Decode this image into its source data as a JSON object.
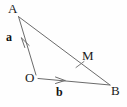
{
  "figure": {
    "type": "geometry-diagram",
    "background_color": "#fefefe",
    "stroke_color": "#5a5a5a",
    "label_color": "#1a1a1a",
    "width": 127,
    "height": 107
  },
  "points": {
    "A": {
      "label": "A",
      "x": 18,
      "y": 16,
      "label_x": 8,
      "label_y": 2
    },
    "O": {
      "label": "O",
      "x": 36,
      "y": 76,
      "label_x": 25,
      "label_y": 72
    },
    "B": {
      "label": "B",
      "x": 110,
      "y": 85,
      "label_x": 112,
      "label_y": 85
    },
    "M": {
      "label": "M",
      "x": 80,
      "y": 66,
      "label_x": 83,
      "label_y": 50
    }
  },
  "segments": [
    {
      "name": "OA",
      "from": "O",
      "to": "A",
      "arrow": true
    },
    {
      "name": "OB",
      "from": "O",
      "to": "B",
      "arrow": true
    },
    {
      "name": "AB",
      "from": "A",
      "to": "B",
      "arrow": false
    }
  ],
  "vectors": {
    "a": {
      "label": "a",
      "label_x": 6,
      "label_y": 32,
      "bold": true
    },
    "b": {
      "label": "b",
      "label_x": 56,
      "label_y": 86,
      "bold": true
    }
  },
  "marks": {
    "midpoint_tick": {
      "name": "midpoint-tick-on-AB",
      "x": 80,
      "y": 66
    }
  }
}
